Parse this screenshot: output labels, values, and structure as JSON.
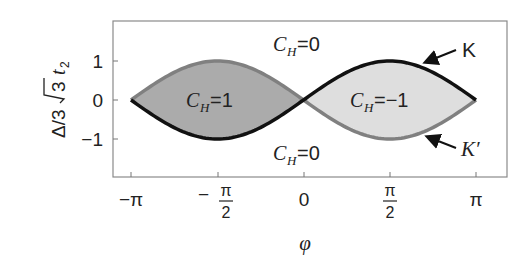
{
  "chart_data": {
    "type": "area",
    "title": "",
    "xlabel": "φ",
    "ylabel": "Δ/3√3 t₂",
    "xlim": [
      -3.4,
      3.4
    ],
    "ylim": [
      -1.9,
      1.9
    ],
    "x_ticks": [
      {
        "value": -3.14159,
        "label": "−π"
      },
      {
        "value": -1.5708,
        "label": "−π/2",
        "num": "π",
        "den": "2",
        "sign": "−"
      },
      {
        "value": 0,
        "label": "0"
      },
      {
        "value": 1.5708,
        "label": "π/2",
        "num": "π",
        "den": "2",
        "sign": ""
      },
      {
        "value": 3.14159,
        "label": "π"
      }
    ],
    "y_ticks": [
      {
        "value": 1,
        "label": "1"
      },
      {
        "value": 0,
        "label": "0"
      },
      {
        "value": -1,
        "label": "−1"
      }
    ],
    "grid": false,
    "series": [
      {
        "name": "K",
        "formula": "-sin(φ)",
        "color": "#7a7a7a",
        "x": [
          -3.1416,
          -2.3562,
          -1.5708,
          -0.7854,
          0,
          0.7854,
          1.5708,
          2.3562,
          3.1416
        ],
        "values": [
          0,
          -0.707,
          -1,
          -0.707,
          0,
          0.707,
          1,
          0.707,
          0
        ]
      },
      {
        "name": "K′",
        "formula": "sin(φ)",
        "color": "#111111",
        "x": [
          -3.1416,
          -2.3562,
          -1.5708,
          -0.7854,
          0,
          0.7854,
          1.5708,
          2.3562,
          3.1416
        ],
        "values": [
          0,
          0.707,
          1,
          0.707,
          0,
          -0.707,
          -1,
          -0.707,
          0
        ]
      }
    ],
    "regions": [
      {
        "label": "C_H=1",
        "x_range": [
          -3.1416,
          0
        ],
        "fill": "#a9a9a9"
      },
      {
        "label": "C_H=-1",
        "x_range": [
          0,
          3.1416
        ],
        "fill": "#dcdcdc"
      },
      {
        "label": "C_H=0",
        "position": "top"
      },
      {
        "label": "C_H=0",
        "position": "bottom"
      }
    ],
    "annotations": [
      {
        "text": "K",
        "arrow_to": "upper curve near φ=2.1"
      },
      {
        "text": "K′",
        "arrow_to": "lower curve near φ=2.1"
      }
    ]
  },
  "labels": {
    "ch_top": {
      "C": "C",
      "sub": "H",
      "rest": "=0"
    },
    "ch_bottom": {
      "C": "C",
      "sub": "H",
      "rest": "=0"
    },
    "ch_left": {
      "C": "C",
      "sub": "H",
      "rest": "=1"
    },
    "ch_right": {
      "C": "C",
      "sub": "H",
      "rest": "=−1"
    },
    "K": "K",
    "Kprime": "K′",
    "ylabel_pre": "Δ/3",
    "ylabel_rad": "3",
    "ylabel_t": "t",
    "ylabel_sub": "2",
    "xlabel": "φ",
    "xt_minus_pi": "−π",
    "xt_zero": "0",
    "xt_pi": "π",
    "xt_frac_num": "π",
    "xt_frac_den": "2",
    "xt_minus": "−",
    "yt_1": "1",
    "yt_0": "0",
    "yt_m1": "−1"
  }
}
